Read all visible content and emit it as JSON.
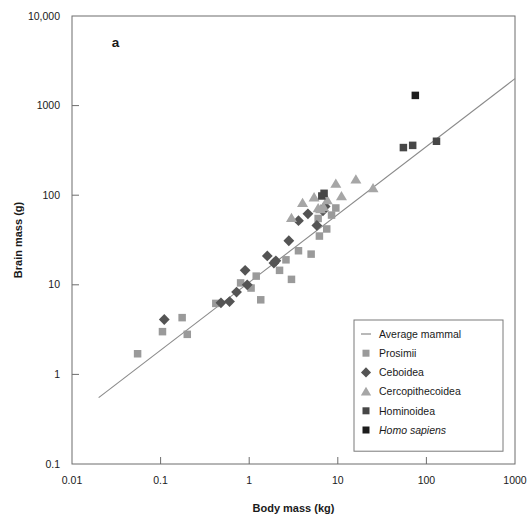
{
  "figure": {
    "panel_label": "a",
    "background_color": "#ffffff"
  },
  "axes": {
    "x": {
      "title": "Body mass (kg)",
      "tick_labels": [
        "0.01",
        "0.1",
        "1",
        "10",
        "100",
        "1000"
      ],
      "tick_values": [
        0.01,
        0.1,
        1,
        10,
        100,
        1000
      ],
      "scale": "log",
      "range": [
        0.01,
        1000
      ]
    },
    "y": {
      "title": "Brain mass (g)",
      "tick_labels": [
        "0.1",
        "1",
        "10",
        "100",
        "1000",
        "10,000"
      ],
      "tick_values": [
        0.1,
        1,
        10,
        100,
        1000,
        10000
      ],
      "scale": "log",
      "range": [
        0.1,
        10000
      ]
    }
  },
  "legend": {
    "position": "inside-bottom-right",
    "items": [
      {
        "label": "Average mammal",
        "marker": "line",
        "color": "#8a8a8a",
        "italic": false
      },
      {
        "label": "Prosimii",
        "marker": "square",
        "color": "#9a9a9a",
        "italic": false
      },
      {
        "label": "Ceboidea",
        "marker": "diamond",
        "color": "#545454",
        "italic": false
      },
      {
        "label": "Cercopithecoidea",
        "marker": "triangle",
        "color": "#a6a6a6",
        "italic": false
      },
      {
        "label": "Hominoidea",
        "marker": "square",
        "color": "#474747",
        "italic": false
      },
      {
        "label": "Homo sapiens",
        "marker": "square",
        "color": "#1c1c1c",
        "italic": true
      }
    ]
  },
  "chart_data": {
    "type": "scatter",
    "title": "",
    "subtitle": "",
    "xlabel": "Body mass (kg)",
    "ylabel": "Brain mass (g)",
    "xscale": "log",
    "yscale": "log",
    "xlim": [
      0.01,
      1000
    ],
    "ylim": [
      0.1,
      10000
    ],
    "grid": false,
    "annotations": [
      {
        "text": "a",
        "x_frac": 0.09,
        "y_frac": 0.07
      }
    ],
    "series": [
      {
        "name": "Average mammal",
        "type": "line",
        "marker": "line",
        "color": "#8a8a8a",
        "x": [
          0.02,
          1000
        ],
        "y": [
          0.55,
          2000
        ]
      },
      {
        "name": "Prosimii",
        "type": "scatter",
        "marker": "square",
        "color": "#9a9a9a",
        "points": [
          [
            0.055,
            1.7
          ],
          [
            0.105,
            3.0
          ],
          [
            0.175,
            4.3
          ],
          [
            0.2,
            2.8
          ],
          [
            0.42,
            6.2
          ],
          [
            0.8,
            10.5
          ],
          [
            1.05,
            9.2
          ],
          [
            1.35,
            6.8
          ],
          [
            1.2,
            12.5
          ],
          [
            2.2,
            14.5
          ],
          [
            2.6,
            19.0
          ],
          [
            3.0,
            11.5
          ],
          [
            3.6,
            24.0
          ],
          [
            5.0,
            22.0
          ],
          [
            6.2,
            35.0
          ],
          [
            6.0,
            55.0
          ],
          [
            8.5,
            60.0
          ],
          [
            9.5,
            72.0
          ],
          [
            7.5,
            42.0
          ]
        ]
      },
      {
        "name": "Ceboidea",
        "type": "scatter",
        "marker": "diamond",
        "color": "#545454",
        "points": [
          [
            0.11,
            4.1
          ],
          [
            0.48,
            6.3
          ],
          [
            0.6,
            6.5
          ],
          [
            0.72,
            8.3
          ],
          [
            0.95,
            10.0
          ],
          [
            0.9,
            14.5
          ],
          [
            1.6,
            21.0
          ],
          [
            1.9,
            17.5
          ],
          [
            2.0,
            18.5
          ],
          [
            2.8,
            31.0
          ],
          [
            3.6,
            52.0
          ],
          [
            4.6,
            62.0
          ],
          [
            6.8,
            67.0
          ],
          [
            7.2,
            75.0
          ],
          [
            5.8,
            46.0
          ]
        ]
      },
      {
        "name": "Cercopithecoidea",
        "type": "scatter",
        "marker": "triangle",
        "color": "#a6a6a6",
        "points": [
          [
            3.0,
            56.0
          ],
          [
            4.0,
            82.0
          ],
          [
            5.4,
            95.0
          ],
          [
            6.0,
            72.0
          ],
          [
            6.4,
            70.0
          ],
          [
            6.9,
            74.0
          ],
          [
            7.6,
            88.0
          ],
          [
            9.5,
            135.0
          ],
          [
            11.0,
            98.0
          ],
          [
            16.0,
            150.0
          ],
          [
            25.0,
            120.0
          ]
        ]
      },
      {
        "name": "Hominoidea",
        "type": "scatter",
        "marker": "square",
        "color": "#474747",
        "points": [
          [
            6.6,
            98.0
          ],
          [
            7.0,
            105.0
          ],
          [
            55.0,
            340.0
          ],
          [
            70.0,
            360.0
          ],
          [
            130.0,
            400.0
          ]
        ]
      },
      {
        "name": "Homo sapiens",
        "type": "scatter",
        "marker": "square",
        "color": "#1c1c1c",
        "points": [
          [
            75.0,
            1300.0
          ]
        ]
      }
    ]
  }
}
